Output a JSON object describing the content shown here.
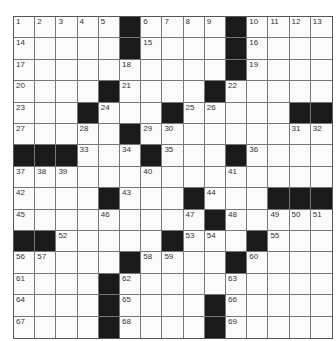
{
  "puzzle": {
    "rows": 15,
    "cols": 15,
    "grid": [
      [
        "1",
        "2",
        "3",
        "4",
        "5",
        "#",
        "6",
        "7",
        "8",
        "9",
        "#",
        "10",
        "11",
        "12",
        "13"
      ],
      [
        "14",
        "",
        "",
        "",
        "",
        "#",
        "15",
        "",
        "",
        "",
        "#",
        "16",
        "",
        "",
        ""
      ],
      [
        "17",
        "",
        "",
        "",
        "",
        "18",
        "",
        "",
        "",
        "",
        "#",
        "19",
        "",
        "",
        ""
      ],
      [
        "20",
        "",
        "",
        "",
        "#",
        "21",
        "",
        "",
        "",
        "#",
        "22",
        "",
        "",
        "",
        ""
      ],
      [
        "23",
        "",
        "",
        "#",
        "24",
        "",
        "",
        "#",
        "25",
        "26",
        "",
        "",
        "",
        "#",
        "#"
      ],
      [
        "27",
        "",
        "",
        "28",
        "",
        "#",
        "29",
        "30",
        "",
        "",
        "",
        "",
        "",
        "31",
        "32"
      ],
      [
        "#",
        "#",
        "#",
        "33",
        "",
        "34",
        "#",
        "35",
        "",
        "",
        "#",
        "36",
        "",
        "",
        ""
      ],
      [
        "37",
        "38",
        "39",
        "",
        "",
        "",
        "40",
        "",
        "",
        "",
        "41",
        "",
        "",
        "",
        ""
      ],
      [
        "42",
        "",
        "",
        "",
        "#",
        "43",
        "",
        "",
        "#",
        "44",
        "",
        "",
        "#",
        "#",
        "#"
      ],
      [
        "45",
        "",
        "",
        "",
        "46",
        "",
        "",
        "",
        "47",
        "#",
        "48",
        "",
        "49",
        "50",
        "51"
      ],
      [
        "#",
        "#",
        "52",
        "",
        "",
        "",
        "",
        "#",
        "53",
        "54",
        "",
        "#",
        "55",
        "",
        ""
      ],
      [
        "56",
        "57",
        "",
        "",
        "",
        "#",
        "58",
        "59",
        "",
        "",
        "#",
        "60",
        "",
        "",
        ""
      ],
      [
        "61",
        "",
        "",
        "",
        "#",
        "62",
        "",
        "",
        "",
        "",
        "63",
        "",
        "",
        "",
        ""
      ],
      [
        "64",
        "",
        "",
        "",
        "#",
        "65",
        "",
        "",
        "",
        "#",
        "66",
        "",
        "",
        "",
        ""
      ],
      [
        "67",
        "",
        "",
        "",
        "#",
        "68",
        "",
        "",
        "",
        "#",
        "69",
        "",
        "",
        "",
        ""
      ]
    ]
  }
}
